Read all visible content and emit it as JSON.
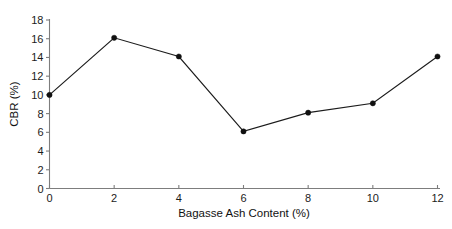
{
  "chart_data": {
    "type": "line",
    "title": "",
    "xlabel": "Bagasse Ash Content (%)",
    "ylabel": "CBR (%)",
    "x": [
      0,
      2,
      4,
      6,
      8,
      10,
      12
    ],
    "values": [
      10.0,
      16.1,
      14.1,
      6.1,
      8.1,
      9.1,
      14.1
    ],
    "series": [
      {
        "name": "CBR",
        "values": [
          10.0,
          16.1,
          14.1,
          6.1,
          8.1,
          9.1,
          14.1
        ]
      }
    ],
    "xlim": [
      0,
      12
    ],
    "ylim": [
      0,
      18
    ],
    "xticks": [
      0,
      2,
      4,
      6,
      8,
      10,
      12
    ],
    "yticks": [
      0,
      2,
      4,
      6,
      8,
      10,
      12,
      14,
      16,
      18
    ],
    "xtick_labels": [
      "0",
      "2",
      "4",
      "6",
      "8",
      "10",
      "12"
    ],
    "ytick_labels": [
      "0",
      "2",
      "4",
      "6",
      "8",
      "10",
      "12",
      "14",
      "16",
      "18"
    ],
    "grid": false,
    "legend": false,
    "legend_position": "none",
    "marker": "filled-circle",
    "line_color": "#1b1b1b",
    "marker_color": "#101010",
    "axis_color": "#7d7d7d",
    "background_color": "#ffffff"
  }
}
